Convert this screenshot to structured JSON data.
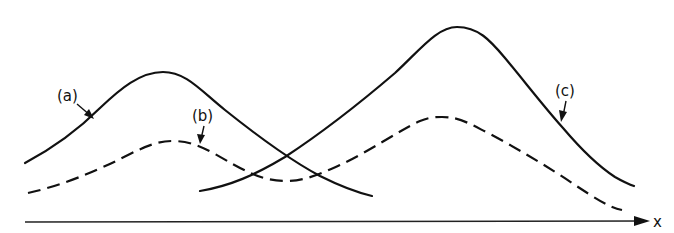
{
  "figure": {
    "axis": {
      "label": "x"
    },
    "curves": [
      {
        "id": "a",
        "label": "(a)",
        "style": "solid",
        "description": "single-peaked curve, left"
      },
      {
        "id": "b",
        "label": "(b)",
        "style": "dashed",
        "description": "two-peaked curve (sum-like lower curve)"
      },
      {
        "id": "c",
        "label": "(c)",
        "style": "solid",
        "description": "single-peaked curve, right, tallest"
      }
    ],
    "colors": {
      "stroke": "#111111",
      "background": "#ffffff"
    }
  }
}
